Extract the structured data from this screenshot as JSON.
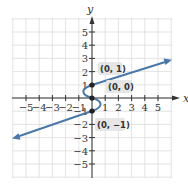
{
  "chart_data": {
    "type": "line",
    "title": "",
    "xlabel": "x",
    "ylabel": "y",
    "xlim": [
      -6,
      6
    ],
    "ylim": [
      -6,
      6
    ],
    "grid": true,
    "x_ticks": [
      -5,
      -4,
      -3,
      -2,
      -1,
      1,
      2,
      3,
      4,
      5
    ],
    "y_ticks": [
      -5,
      -4,
      -3,
      -2,
      -1,
      1,
      2,
      3,
      4,
      5
    ],
    "x_tick_labels": [
      "−5",
      "−4",
      "−3",
      "−2",
      "−1",
      "1",
      "2",
      "3",
      "4",
      "5"
    ],
    "y_tick_labels": [
      "−5",
      "−4",
      "−3",
      "−2",
      "−1",
      "1",
      "2",
      "3",
      "4",
      "5"
    ],
    "series": [
      {
        "name": "curve",
        "color": "#4a78a8",
        "description": "Line y = x/3 + 1 for x >= 0 (arrow toward upper right), S-shaped curve through (0,1), (0,0), (0,-1), and line y = x/3 - 1 for x <= 0 (arrow toward lower left)",
        "points": [
          [
            -5.8,
            -2.93
          ],
          [
            0,
            -1
          ],
          [
            0.6,
            -0.5
          ],
          [
            0,
            0
          ],
          [
            -0.6,
            0.5
          ],
          [
            0,
            1
          ],
          [
            5.9,
            2.97
          ]
        ]
      }
    ],
    "annotations": [
      {
        "label": "(0, 1)",
        "x": 0,
        "y": 1
      },
      {
        "label": "(0, 0)",
        "x": 0,
        "y": 0
      },
      {
        "label": "(0, −1)",
        "x": 0,
        "y": -1
      }
    ]
  },
  "axes": {
    "x_name": "x",
    "y_name": "y"
  },
  "labels": {
    "p1": "(0, 1)",
    "p0": "(0, 0)",
    "pm1": "(0, −1)"
  },
  "colors": {
    "curve": "#4a78a8",
    "grid": "#dcdcdc",
    "axis": "#333333",
    "point": "#222222"
  }
}
